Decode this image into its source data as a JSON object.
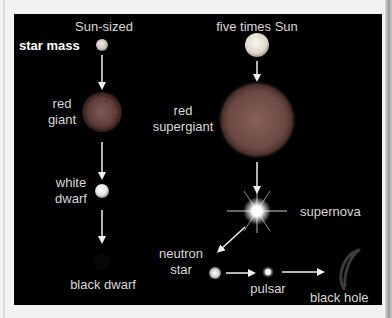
{
  "diagram": {
    "row_label": "star mass",
    "columns": [
      {
        "heading": "Sun-sized",
        "stages": [
          "red giant",
          "white dwarf",
          "black dwarf"
        ]
      },
      {
        "heading": "five times Sun",
        "stages": [
          "red supergiant",
          "supernova",
          "neutron star",
          "pulsar",
          "black hole"
        ]
      }
    ],
    "labels": {
      "sun_sized": "Sun-sized",
      "star_mass": "star mass",
      "red_giant_1": "red",
      "red_giant_2": "giant",
      "white_dwarf_1": "white",
      "white_dwarf_2": "dwarf",
      "black_dwarf": "black dwarf",
      "five_times_sun": "five times Sun",
      "red_supergiant_1": "red",
      "red_supergiant_2": "supergiant",
      "supernova": "supernova",
      "neutron_star_1": "neutron",
      "neutron_star_2": "star",
      "pulsar": "pulsar",
      "black_hole": "black hole"
    },
    "colors": {
      "background": "#000000",
      "text": "#d8d8d8",
      "arrow": "#f0f0f0",
      "red_giant": "#7a4a44",
      "frame": "#f2f2f2"
    }
  }
}
